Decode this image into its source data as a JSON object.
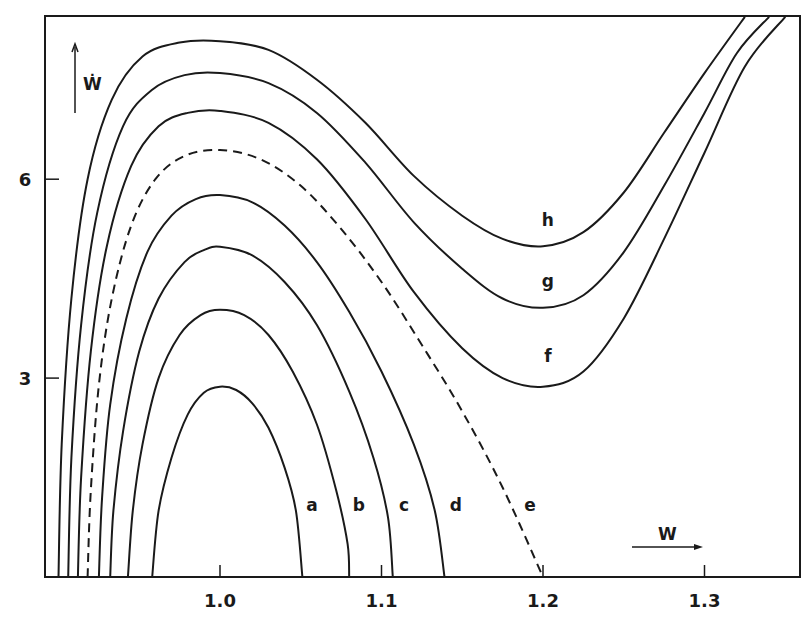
{
  "chart_data": {
    "type": "line",
    "title": "",
    "xlabel": "W",
    "ylabel": "Ẇ",
    "xlim": [
      0.9,
      1.36
    ],
    "ylim": [
      0,
      8.5
    ],
    "grid": false,
    "legend": "none (curves labelled a–h directly)",
    "x_ticks": [
      {
        "value": 1.0,
        "label": "1.0"
      },
      {
        "value": 1.1,
        "label": "1.1"
      },
      {
        "value": 1.2,
        "label": "1.2"
      },
      {
        "value": 1.3,
        "label": "1.3"
      }
    ],
    "y_ticks": [
      {
        "value": 3,
        "label": "3"
      },
      {
        "value": 6,
        "label": "6"
      }
    ],
    "series": [
      {
        "name": "a",
        "style": "solid",
        "label_at": [
          1.057,
          1.0
        ],
        "points": [
          [
            0.958,
            0
          ],
          [
            0.962,
            1.0
          ],
          [
            0.97,
            1.8
          ],
          [
            0.98,
            2.45
          ],
          [
            0.99,
            2.78
          ],
          [
            1.0,
            2.87
          ],
          [
            1.01,
            2.82
          ],
          [
            1.02,
            2.62
          ],
          [
            1.03,
            2.25
          ],
          [
            1.04,
            1.65
          ],
          [
            1.047,
            1.0
          ],
          [
            1.051,
            0
          ]
        ]
      },
      {
        "name": "b",
        "style": "solid",
        "label_at": [
          1.086,
          1.0
        ],
        "points": [
          [
            0.943,
            0
          ],
          [
            0.946,
            1.0
          ],
          [
            0.952,
            2.0
          ],
          [
            0.962,
            3.0
          ],
          [
            0.975,
            3.65
          ],
          [
            0.988,
            3.95
          ],
          [
            1.0,
            4.03
          ],
          [
            1.015,
            3.95
          ],
          [
            1.03,
            3.65
          ],
          [
            1.045,
            3.1
          ],
          [
            1.06,
            2.3
          ],
          [
            1.072,
            1.3
          ],
          [
            1.079,
            0.5
          ],
          [
            1.08,
            0
          ]
        ]
      },
      {
        "name": "c",
        "style": "solid",
        "label_at": [
          1.114,
          1.0
        ],
        "points": [
          [
            0.932,
            0
          ],
          [
            0.934,
            1.0
          ],
          [
            0.94,
            2.2
          ],
          [
            0.95,
            3.4
          ],
          [
            0.962,
            4.2
          ],
          [
            0.978,
            4.75
          ],
          [
            0.99,
            4.93
          ],
          [
            1.0,
            4.98
          ],
          [
            1.02,
            4.85
          ],
          [
            1.04,
            4.45
          ],
          [
            1.06,
            3.8
          ],
          [
            1.08,
            2.8
          ],
          [
            1.095,
            1.8
          ],
          [
            1.104,
            0.9
          ],
          [
            1.107,
            0
          ]
        ]
      },
      {
        "name": "d",
        "style": "solid",
        "label_at": [
          1.146,
          1.0
        ],
        "points": [
          [
            0.925,
            0
          ],
          [
            0.927,
            1.2
          ],
          [
            0.932,
            2.6
          ],
          [
            0.942,
            3.9
          ],
          [
            0.955,
            4.9
          ],
          [
            0.97,
            5.45
          ],
          [
            0.985,
            5.7
          ],
          [
            1.0,
            5.76
          ],
          [
            1.02,
            5.65
          ],
          [
            1.04,
            5.3
          ],
          [
            1.06,
            4.75
          ],
          [
            1.08,
            4.0
          ],
          [
            1.1,
            3.1
          ],
          [
            1.12,
            2.0
          ],
          [
            1.133,
            1.0
          ],
          [
            1.139,
            0
          ]
        ]
      },
      {
        "name": "e",
        "style": "dashed",
        "label_at": [
          1.192,
          1.0
        ],
        "points": [
          [
            0.918,
            0
          ],
          [
            0.92,
            1.3
          ],
          [
            0.925,
            2.9
          ],
          [
            0.933,
            4.2
          ],
          [
            0.945,
            5.3
          ],
          [
            0.96,
            6.0
          ],
          [
            0.978,
            6.35
          ],
          [
            1.0,
            6.44
          ],
          [
            1.025,
            6.3
          ],
          [
            1.05,
            5.9
          ],
          [
            1.075,
            5.25
          ],
          [
            1.1,
            4.45
          ],
          [
            1.125,
            3.5
          ],
          [
            1.15,
            2.5
          ],
          [
            1.175,
            1.35
          ],
          [
            1.2,
            0
          ]
        ]
      },
      {
        "name": "f",
        "style": "solid",
        "label_at": [
          1.203,
          3.25
        ],
        "points": [
          [
            0.912,
            0
          ],
          [
            0.914,
            1.5
          ],
          [
            0.92,
            3.4
          ],
          [
            0.93,
            5.0
          ],
          [
            0.945,
            6.2
          ],
          [
            0.962,
            6.8
          ],
          [
            0.98,
            7.0
          ],
          [
            1.0,
            7.03
          ],
          [
            1.03,
            6.85
          ],
          [
            1.06,
            6.3
          ],
          [
            1.09,
            5.4
          ],
          [
            1.12,
            4.3
          ],
          [
            1.15,
            3.45
          ],
          [
            1.175,
            3.0
          ],
          [
            1.2,
            2.87
          ],
          [
            1.225,
            3.1
          ],
          [
            1.25,
            3.9
          ],
          [
            1.275,
            5.1
          ],
          [
            1.3,
            6.4
          ],
          [
            1.325,
            7.7
          ],
          [
            1.35,
            8.45
          ]
        ]
      },
      {
        "name": "g",
        "style": "solid",
        "label_at": [
          1.203,
          4.38
        ],
        "points": [
          [
            0.906,
            0
          ],
          [
            0.908,
            1.8
          ],
          [
            0.914,
            3.8
          ],
          [
            0.924,
            5.5
          ],
          [
            0.94,
            6.8
          ],
          [
            0.958,
            7.35
          ],
          [
            0.978,
            7.57
          ],
          [
            1.0,
            7.6
          ],
          [
            1.03,
            7.45
          ],
          [
            1.06,
            7.0
          ],
          [
            1.09,
            6.25
          ],
          [
            1.12,
            5.35
          ],
          [
            1.15,
            4.65
          ],
          [
            1.175,
            4.2
          ],
          [
            1.2,
            4.06
          ],
          [
            1.225,
            4.25
          ],
          [
            1.25,
            4.9
          ],
          [
            1.275,
            5.9
          ],
          [
            1.3,
            7.0
          ],
          [
            1.32,
            7.9
          ],
          [
            1.34,
            8.45
          ]
        ]
      },
      {
        "name": "h",
        "style": "solid",
        "label_at": [
          1.203,
          5.3
        ],
        "points": [
          [
            0.9,
            0
          ],
          [
            0.902,
            2.0
          ],
          [
            0.908,
            4.2
          ],
          [
            0.918,
            6.0
          ],
          [
            0.933,
            7.2
          ],
          [
            0.952,
            7.85
          ],
          [
            0.975,
            8.06
          ],
          [
            1.0,
            8.08
          ],
          [
            1.03,
            7.95
          ],
          [
            1.06,
            7.5
          ],
          [
            1.09,
            6.85
          ],
          [
            1.12,
            6.05
          ],
          [
            1.15,
            5.45
          ],
          [
            1.175,
            5.1
          ],
          [
            1.2,
            4.99
          ],
          [
            1.225,
            5.2
          ],
          [
            1.25,
            5.8
          ],
          [
            1.275,
            6.7
          ],
          [
            1.3,
            7.6
          ],
          [
            1.325,
            8.45
          ]
        ]
      }
    ],
    "annotations": [
      {
        "text": "Ẇ",
        "type": "axis-arrow",
        "direction": "up"
      },
      {
        "text": "W",
        "type": "axis-arrow",
        "direction": "right"
      }
    ]
  },
  "frame": {
    "left": 45,
    "top": 16,
    "right": 800,
    "bottom": 577
  },
  "mapping": {
    "x0_val": 1.0,
    "x0_px": 220,
    "px_per_x": 1615,
    "y0_px": 577,
    "px_per_y": 66.3
  },
  "labels": {
    "x_axis_name": "W",
    "y_axis_name": "Ẇ"
  }
}
